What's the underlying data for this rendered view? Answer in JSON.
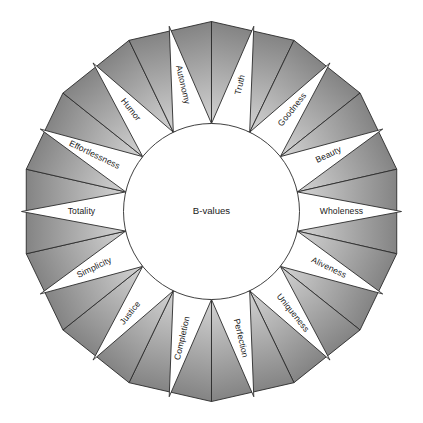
{
  "figure": {
    "name": "b-values-wheel",
    "center_label": "B-values",
    "background_color": "#ffffff",
    "outline_color": "#2b2b2b",
    "wedge_gradient_dark": "#808080",
    "wedge_gradient_light": "#f2f2f2",
    "spike_fill": "#ffffff",
    "segment_count": 14
  },
  "chart_data": {
    "type": "pie",
    "title": "B-values",
    "categories": [
      "Truth",
      "Goodness",
      "Beauty",
      "Wholeness",
      "Aliveness",
      "Uniqueness",
      "Perfection",
      "Completion",
      "Justice",
      "Simplicity",
      "Totality",
      "Effortlessness",
      "Humor",
      "Autonomy"
    ],
    "values": [
      1,
      1,
      1,
      1,
      1,
      1,
      1,
      1,
      1,
      1,
      1,
      1,
      1,
      1
    ],
    "xlabel": "",
    "ylabel": "",
    "legend": "none",
    "grid": false
  },
  "segments": [
    {
      "label": "Truth",
      "angle_deg": -77.14
    },
    {
      "label": "Goodness",
      "angle_deg": -51.43
    },
    {
      "label": "Beauty",
      "angle_deg": -25.71
    },
    {
      "label": "Wholeness",
      "angle_deg": 0.0
    },
    {
      "label": "Aliveness",
      "angle_deg": 25.71
    },
    {
      "label": "Uniqueness",
      "angle_deg": 51.43
    },
    {
      "label": "Perfection",
      "angle_deg": 77.14
    },
    {
      "label": "Completion",
      "angle_deg": 102.86
    },
    {
      "label": "Justice",
      "angle_deg": 128.57
    },
    {
      "label": "Simplicity",
      "angle_deg": 154.29
    },
    {
      "label": "Totality",
      "angle_deg": 180.0
    },
    {
      "label": "Effortlessness",
      "angle_deg": -154.29
    },
    {
      "label": "Humor",
      "angle_deg": -128.57
    },
    {
      "label": "Autonomy",
      "angle_deg": -102.86
    }
  ]
}
